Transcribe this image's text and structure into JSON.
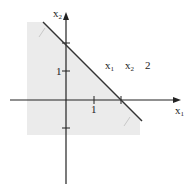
{
  "diagram": {
    "type": "linear-inequality-region",
    "axes": {
      "x_label": "x",
      "x_sub": "1",
      "y_label": "x",
      "y_sub": "2"
    },
    "ticks": {
      "x_one": "1",
      "y_one": "1"
    },
    "inequality": {
      "var1": "x",
      "var1_sub": "1",
      "var2": "x",
      "var2_sub": "2",
      "rhs": "2"
    },
    "colors": {
      "shade": "#ececec",
      "line": "#333333",
      "axis": "#222222"
    }
  }
}
